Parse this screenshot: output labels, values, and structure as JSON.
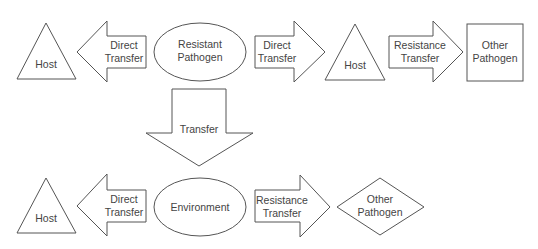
{
  "diagram": {
    "row1": {
      "host_left": "Host",
      "arrow_left": [
        "Direct",
        "Transfer"
      ],
      "resistant_pathogen": [
        "Resistant",
        "Pathogen"
      ],
      "arrow_right1": [
        "Direct",
        "Transfer"
      ],
      "host_mid": "Host",
      "arrow_right2": [
        "Resistance",
        "Transfer"
      ],
      "other_pathogen": [
        "Other",
        "Pathogen"
      ]
    },
    "down_arrow": "Transfer",
    "row2": {
      "host_left": "Host",
      "arrow_left": [
        "Direct",
        "Transfer"
      ],
      "environment": "Environment",
      "arrow_right": [
        "Resistance",
        "Transfer"
      ],
      "other_pathogen": [
        "Other",
        "Pathogen"
      ]
    }
  }
}
